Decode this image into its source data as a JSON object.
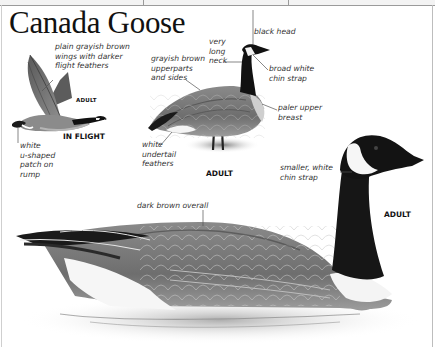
{
  "page": {
    "title": "Canada Goose"
  },
  "figures": {
    "in_flight": {
      "caption": "IN FLIGHT",
      "age": "ADULT",
      "labels": {
        "wings": "plain grayish brown\nwings with darker\nflight feathers",
        "rump": "white\nu-shaped\npatch on\nrump"
      }
    },
    "standing": {
      "caption": "ADULT",
      "labels": {
        "head": "black head",
        "neck": "very\nlong\nneck",
        "chin": "broad white\nchin strap",
        "upperparts": "grayish brown\nupperparts\nand sides",
        "breast": "paler upper\nbreast",
        "undertail": "white\nundertail\nfeathers"
      }
    },
    "swimming": {
      "caption": "ADULT",
      "labels": {
        "overall": "dark brown overall",
        "chin": "smaller, white\nchin strap"
      }
    }
  },
  "colors": {
    "text": "#111111",
    "label": "#333333",
    "leader_line": "#555555"
  }
}
